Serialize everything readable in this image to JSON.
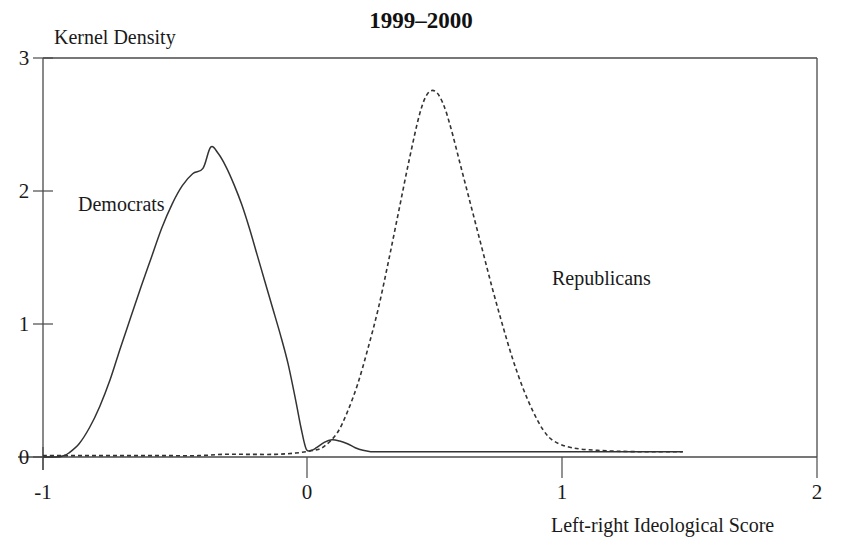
{
  "chart_data": {
    "type": "line",
    "title": "1999–2000",
    "xlabel": "Left-right Ideological Score",
    "ylabel": "Kernel Density",
    "xlim": [
      -1,
      2
    ],
    "ylim": [
      0,
      3
    ],
    "xticks": [
      "-1",
      "0",
      "1",
      "2"
    ],
    "xtick_values": [
      -1,
      0,
      1,
      2
    ],
    "yticks": [
      "0",
      "1",
      "2",
      "3"
    ],
    "ytick_values": [
      0,
      1,
      2,
      3
    ],
    "grid": false,
    "legend_position": "inline-annotations",
    "annotations": [
      {
        "text": "Democrats",
        "x": -0.71,
        "y": 1.97
      },
      {
        "text": "Republicans",
        "x": 0.95,
        "y": 1.41
      }
    ],
    "series": [
      {
        "name": "Democrats",
        "style": "solid",
        "color": "#333333",
        "x": [
          -1.0,
          -0.95,
          -0.92,
          -0.9,
          -0.86,
          -0.82,
          -0.78,
          -0.74,
          -0.7,
          -0.66,
          -0.62,
          -0.58,
          -0.54,
          -0.5,
          -0.46,
          -0.42,
          -0.38,
          -0.35,
          -0.32,
          -0.29,
          -0.26,
          -0.23,
          -0.2,
          -0.17,
          -0.14,
          -0.11,
          -0.08,
          -0.05,
          -0.02,
          0.0,
          0.02,
          0.04,
          0.06,
          0.09,
          0.12,
          0.15,
          0.18,
          0.21,
          0.24,
          0.27,
          0.3,
          0.4,
          0.55,
          0.7,
          0.85,
          1.0,
          1.15,
          1.3,
          1.48
        ],
        "y": [
          0.0,
          0.0,
          0.01,
          0.03,
          0.1,
          0.22,
          0.38,
          0.58,
          0.82,
          1.05,
          1.28,
          1.5,
          1.72,
          1.9,
          2.04,
          2.13,
          2.17,
          2.33,
          2.28,
          2.18,
          2.05,
          1.9,
          1.72,
          1.52,
          1.32,
          1.12,
          0.92,
          0.7,
          0.42,
          0.22,
          0.06,
          0.05,
          0.07,
          0.11,
          0.13,
          0.12,
          0.1,
          0.07,
          0.05,
          0.04,
          0.04,
          0.04,
          0.04,
          0.04,
          0.04,
          0.04,
          0.04,
          0.04,
          0.04
        ]
      },
      {
        "name": "Republicans",
        "style": "dashed",
        "color": "#333333",
        "x": [
          -1.0,
          -0.9,
          -0.8,
          -0.7,
          -0.6,
          -0.5,
          -0.4,
          -0.3,
          -0.2,
          -0.1,
          -0.02,
          0.05,
          0.09,
          0.14,
          0.18,
          0.22,
          0.26,
          0.3,
          0.34,
          0.38,
          0.42,
          0.46,
          0.49,
          0.52,
          0.55,
          0.58,
          0.62,
          0.66,
          0.7,
          0.74,
          0.78,
          0.82,
          0.86,
          0.9,
          0.94,
          0.98,
          1.05,
          1.15,
          1.3,
          1.48
        ],
        "y": [
          0.01,
          0.01,
          0.01,
          0.01,
          0.01,
          0.01,
          0.01,
          0.02,
          0.02,
          0.02,
          0.03,
          0.05,
          0.08,
          0.18,
          0.34,
          0.55,
          0.82,
          1.12,
          1.48,
          1.86,
          2.24,
          2.58,
          2.73,
          2.75,
          2.66,
          2.48,
          2.18,
          1.88,
          1.58,
          1.28,
          1.0,
          0.74,
          0.52,
          0.34,
          0.2,
          0.12,
          0.07,
          0.05,
          0.04,
          0.04
        ]
      }
    ]
  }
}
